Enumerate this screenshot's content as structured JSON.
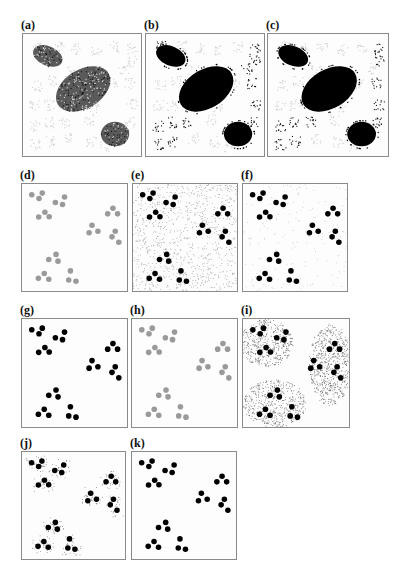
{
  "figure": {
    "panels": [
      {
        "id": "a",
        "label": "(a)",
        "x": 22,
        "y": 33,
        "w": 120,
        "h": 124,
        "kind": "blobs",
        "blob_color": "#2a2a2a",
        "blob_texture": true,
        "cluster_color": "#c8c8c8",
        "cluster_mode": "faint-all"
      },
      {
        "id": "b",
        "label": "(b)",
        "x": 145,
        "y": 33,
        "w": 120,
        "h": 124,
        "kind": "blobs",
        "blob_color": "#000000",
        "blob_texture": false,
        "cluster_color": "#111111",
        "cluster_mode": "dark-some"
      },
      {
        "id": "c",
        "label": "(c)",
        "x": 267,
        "y": 33,
        "w": 122,
        "h": 124,
        "kind": "blobs",
        "blob_color": "#000000",
        "blob_texture": false,
        "cluster_color": "#111111",
        "cluster_mode": "dark-few"
      },
      {
        "id": "d",
        "label": "(d)",
        "x": 21,
        "y": 183,
        "w": 107,
        "h": 109,
        "kind": "dots",
        "dot_color": "#9a9a9a",
        "noise": "none"
      },
      {
        "id": "e",
        "label": "(e)",
        "x": 132,
        "y": 183,
        "w": 106,
        "h": 109,
        "kind": "dots",
        "dot_color": "#000000",
        "noise": "uniform"
      },
      {
        "id": "f",
        "label": "(f)",
        "x": 242,
        "y": 183,
        "w": 106,
        "h": 109,
        "kind": "dots",
        "dot_color": "#000000",
        "noise": "light"
      },
      {
        "id": "g",
        "label": "(g)",
        "x": 21,
        "y": 318,
        "w": 107,
        "h": 110,
        "kind": "dots",
        "dot_color": "#000000",
        "noise": "none"
      },
      {
        "id": "h",
        "label": "(h)",
        "x": 131,
        "y": 318,
        "w": 107,
        "h": 110,
        "kind": "dots",
        "dot_color": "#9a9a9a",
        "noise": "none"
      },
      {
        "id": "i",
        "label": "(i)",
        "x": 242,
        "y": 318,
        "w": 108,
        "h": 110,
        "kind": "dots",
        "dot_color": "#000000",
        "noise": "regions"
      },
      {
        "id": "j",
        "label": "(j)",
        "x": 21,
        "y": 451,
        "w": 105,
        "h": 109,
        "kind": "dots",
        "dot_color": "#000000",
        "noise": "halo"
      },
      {
        "id": "k",
        "label": "(k)",
        "x": 131,
        "y": 451,
        "w": 106,
        "h": 109,
        "kind": "dots",
        "dot_color": "#000000",
        "noise": "none"
      }
    ],
    "dot_layout": [
      [
        9.3,
        10
      ],
      [
        19.3,
        8.5
      ],
      [
        16.2,
        13.6
      ],
      [
        31.8,
        17.3
      ],
      [
        40.5,
        12.1
      ],
      [
        38.6,
        19.1
      ],
      [
        15.9,
        30.9
      ],
      [
        21.8,
        26.4
      ],
      [
        25.9,
        30.6
      ],
      [
        81.6,
        27.9
      ],
      [
        86.6,
        22.7
      ],
      [
        91,
        27.9
      ],
      [
        63.9,
        45.5
      ],
      [
        66.7,
        38.5
      ],
      [
        72.3,
        44.2
      ],
      [
        88.8,
        44.2
      ],
      [
        85.7,
        49.4
      ],
      [
        92.2,
        54.5
      ],
      [
        25.5,
        70.6
      ],
      [
        32.4,
        65.8
      ],
      [
        34.3,
        72.1
      ],
      [
        15.6,
        88.2
      ],
      [
        21.2,
        83.6
      ],
      [
        25.5,
        89.1
      ],
      [
        44.5,
        89.7
      ],
      [
        46.1,
        81.2
      ],
      [
        51.4,
        90.9
      ]
    ],
    "blobs": [
      {
        "cx": 21,
        "cy": 18,
        "rx": 13,
        "ry": 8,
        "rot": 22
      },
      {
        "cx": 51,
        "cy": 45,
        "rx": 25,
        "ry": 16,
        "rot": -30
      },
      {
        "cx": 78,
        "cy": 82,
        "rx": 12,
        "ry": 10,
        "rot": 0
      }
    ],
    "blob_clusters": [
      [
        12,
        10
      ],
      [
        30,
        10
      ],
      [
        45,
        12
      ],
      [
        62,
        13
      ],
      [
        78,
        10
      ],
      [
        92,
        12
      ],
      [
        92,
        22
      ],
      [
        85,
        28
      ],
      [
        12,
        42
      ],
      [
        25,
        38
      ],
      [
        40,
        30
      ],
      [
        75,
        40
      ],
      [
        90,
        40
      ],
      [
        10,
        58
      ],
      [
        22,
        58
      ],
      [
        35,
        55
      ],
      [
        60,
        60
      ],
      [
        92,
        58
      ],
      [
        10,
        75
      ],
      [
        22,
        72
      ],
      [
        35,
        72
      ],
      [
        55,
        70
      ],
      [
        90,
        72
      ],
      [
        10,
        90
      ],
      [
        22,
        88
      ],
      [
        40,
        85
      ],
      [
        58,
        88
      ],
      [
        70,
        92
      ]
    ],
    "regions_i": [
      {
        "cx": 22,
        "cy": 22,
        "rx": 25,
        "ry": 22
      },
      {
        "cx": 82,
        "cy": 42,
        "rx": 20,
        "ry": 38
      },
      {
        "cx": 30,
        "cy": 78,
        "rx": 30,
        "ry": 22
      }
    ]
  }
}
